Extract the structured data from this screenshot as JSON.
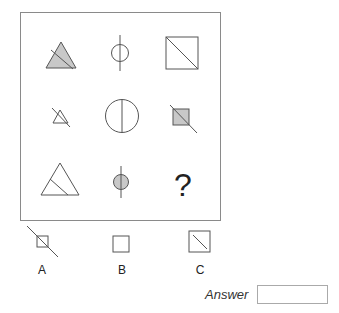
{
  "puzzle": {
    "grid": [
      [
        {
          "shape": "triangle-filled-with-diagonal-line",
          "icon": "filled-triangle-icon"
        },
        {
          "shape": "small-circle-with-vertical-line",
          "icon": "circle-vertical-line-icon"
        },
        {
          "shape": "square-with-diagonal",
          "icon": "square-diagonal-icon"
        }
      ],
      [
        {
          "shape": "small-triangle-outline-with-diagonal-line",
          "icon": "small-triangle-icon"
        },
        {
          "shape": "large-circle-with-vertical-diameter",
          "icon": "large-circle-icon"
        },
        {
          "shape": "small-filled-square-with-diagonal-line",
          "icon": "filled-square-icon"
        }
      ],
      [
        {
          "shape": "large-triangle-outline-with-inner-line",
          "icon": "large-triangle-icon"
        },
        {
          "shape": "small-filled-circle-with-vertical-line",
          "icon": "filled-circle-icon"
        },
        {
          "shape": "missing",
          "text": "?"
        }
      ]
    ],
    "colors": {
      "fill": "#c8c8c8",
      "stroke": "#555555",
      "frame": "#8a8a8a"
    }
  },
  "options": [
    {
      "label": "A",
      "shape": "small-square-with-long-diagonal-line"
    },
    {
      "label": "B",
      "shape": "square-outline"
    },
    {
      "label": "C",
      "shape": "square-with-diagonal"
    }
  ],
  "answer": {
    "label": "Answer",
    "value": ""
  }
}
